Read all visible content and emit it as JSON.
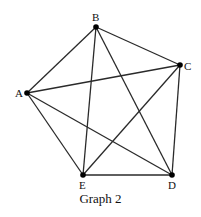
{
  "diagram": {
    "caption": "Graph 2",
    "type": "complete-graph-K5",
    "vertices": [
      {
        "id": "A",
        "label": "A",
        "x": 27,
        "y": 93,
        "lx": 15,
        "ly": 97
      },
      {
        "id": "B",
        "label": "B",
        "x": 96,
        "y": 27,
        "lx": 92,
        "ly": 21
      },
      {
        "id": "C",
        "label": "C",
        "x": 180,
        "y": 65,
        "lx": 184,
        "ly": 70
      },
      {
        "id": "D",
        "label": "D",
        "x": 172,
        "y": 175,
        "lx": 168,
        "ly": 189
      },
      {
        "id": "E",
        "label": "E",
        "x": 83,
        "y": 175,
        "lx": 79,
        "ly": 189
      }
    ],
    "edges": [
      [
        "A",
        "B"
      ],
      [
        "A",
        "C"
      ],
      [
        "A",
        "D"
      ],
      [
        "A",
        "E"
      ],
      [
        "B",
        "C"
      ],
      [
        "B",
        "D"
      ],
      [
        "B",
        "E"
      ],
      [
        "C",
        "D"
      ],
      [
        "C",
        "E"
      ],
      [
        "D",
        "E"
      ]
    ]
  }
}
